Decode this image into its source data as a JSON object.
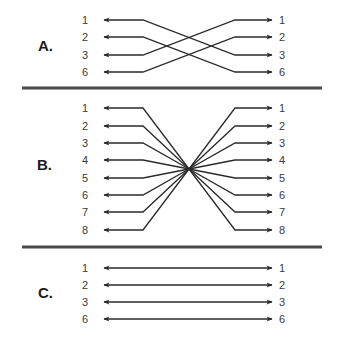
{
  "colors": {
    "wire": "#2a2a2a",
    "divider": "#4a4a4a",
    "text": "#3a3a3a",
    "background": "#ffffff"
  },
  "geometry": {
    "left_label_x": 85,
    "right_label_x": 282,
    "left_tip_x": 104,
    "right_tip_x": 272,
    "left_bend_x": 143,
    "right_bend_x": 235,
    "divider_x1": 22,
    "divider_x2": 322
  },
  "dividers": [
    {
      "y": 88
    },
    {
      "y": 247
    }
  ],
  "sections": [
    {
      "id": "A",
      "label": "A.",
      "type": "crossover",
      "label_x": 38,
      "label_y": 51,
      "rows_y": [
        20,
        37,
        55,
        72
      ],
      "left_pins": [
        "1",
        "2",
        "3",
        "6"
      ],
      "right_pins": [
        "1",
        "2",
        "3",
        "6"
      ],
      "connections": [
        {
          "from": "1",
          "to": "3"
        },
        {
          "from": "2",
          "to": "6"
        },
        {
          "from": "3",
          "to": "1"
        },
        {
          "from": "6",
          "to": "2"
        }
      ]
    },
    {
      "id": "B",
      "label": "B.",
      "type": "rollover",
      "label_x": 37,
      "label_y": 170,
      "rows_y": [
        108,
        126,
        143,
        160,
        178,
        195,
        212,
        230
      ],
      "center": {
        "x": 189,
        "y": 169
      },
      "left_pins": [
        "1",
        "2",
        "3",
        "4",
        "5",
        "6",
        "7",
        "8"
      ],
      "right_pins": [
        "1",
        "2",
        "3",
        "4",
        "5",
        "6",
        "7",
        "8"
      ],
      "connections": [
        {
          "from": "1",
          "to": "8"
        },
        {
          "from": "2",
          "to": "7"
        },
        {
          "from": "3",
          "to": "6"
        },
        {
          "from": "4",
          "to": "5"
        },
        {
          "from": "5",
          "to": "4"
        },
        {
          "from": "6",
          "to": "3"
        },
        {
          "from": "7",
          "to": "2"
        },
        {
          "from": "8",
          "to": "1"
        }
      ]
    },
    {
      "id": "C",
      "label": "C.",
      "type": "straight-through",
      "label_x": 38,
      "label_y": 298,
      "rows_y": [
        268,
        285,
        302,
        319
      ],
      "left_pins": [
        "1",
        "2",
        "3",
        "6"
      ],
      "right_pins": [
        "1",
        "2",
        "3",
        "6"
      ],
      "connections": [
        {
          "from": "1",
          "to": "1"
        },
        {
          "from": "2",
          "to": "2"
        },
        {
          "from": "3",
          "to": "3"
        },
        {
          "from": "6",
          "to": "6"
        }
      ]
    }
  ]
}
